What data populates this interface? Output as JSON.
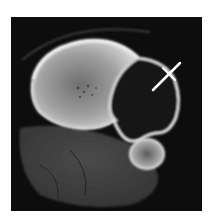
{
  "image": {
    "kind": "axial CT scan",
    "annotation": {
      "type": "arrow",
      "color": "#ffffff"
    }
  }
}
